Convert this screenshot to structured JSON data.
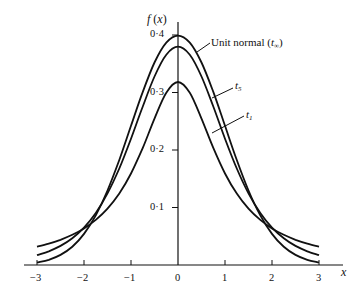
{
  "chart_data": {
    "type": "line",
    "title": "",
    "xlabel": "x",
    "ylabel": "f(x)",
    "xlim": [
      -3,
      3
    ],
    "ylim": [
      0,
      0.4
    ],
    "grid": false,
    "x_ticks": [
      "-3",
      "-2",
      "-1",
      "0",
      "1",
      "2",
      "3"
    ],
    "x_tick_values": [
      -3,
      -2,
      -1,
      0,
      1,
      2,
      3
    ],
    "y_ticks": [
      "0·1",
      "0·2",
      "0·3",
      "0·4"
    ],
    "y_tick_values": [
      0.1,
      0.2,
      0.3,
      0.4
    ],
    "x_half": [
      0,
      0.25,
      0.5,
      0.75,
      1,
      1.25,
      1.5,
      1.75,
      2,
      2.25,
      2.5,
      2.75,
      3
    ],
    "symmetric_about_zero": true,
    "series": [
      {
        "name": "Unit normal (t∞)",
        "label_main": "Unit normal (",
        "label_sym": "t",
        "label_sub": "∞",
        "label_end": ")",
        "values": [
          0.3989,
          0.3867,
          0.3521,
          0.3011,
          0.242,
          0.1826,
          0.1295,
          0.0863,
          0.054,
          0.0317,
          0.0175,
          0.0091,
          0.0044
        ]
      },
      {
        "name": "t5",
        "label_sym": "t",
        "label_sub": "5",
        "values": [
          0.3796,
          0.3657,
          0.3279,
          0.2757,
          0.2197,
          0.1679,
          0.1245,
          0.0905,
          0.0651,
          0.0466,
          0.0333,
          0.0239,
          0.0173
        ]
      },
      {
        "name": "t1",
        "label_sym": "t",
        "label_sub": "1",
        "values": [
          0.3183,
          0.2996,
          0.2546,
          0.2037,
          0.1592,
          0.1242,
          0.0979,
          0.0784,
          0.0637,
          0.0525,
          0.0439,
          0.0372,
          0.0318
        ]
      }
    ],
    "annotations": [
      "Unit normal (t∞)",
      "t5",
      "t1"
    ]
  },
  "labels": {
    "ylabel_f": "f",
    "ylabel_x": "(x)",
    "xlabel": "x"
  }
}
